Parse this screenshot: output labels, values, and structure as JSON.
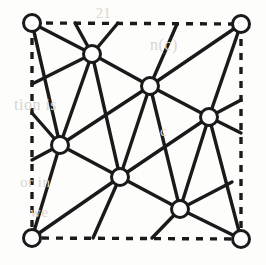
{
  "figure": {
    "canvas": {
      "width": 266,
      "height": 265
    },
    "colors": {
      "background": "#fdfdfc",
      "edge": "#1a1a1a",
      "vertex_fill": "#ffffff",
      "vertex_stroke": "#1a1a1a",
      "boundary": "#1a1a1a",
      "ghost_text": "#d8d5cf"
    },
    "style": {
      "edge_width": 3.4,
      "vertex_radius": 8.5,
      "vertex_stroke_width": 3.0,
      "boundary_width": 3.4,
      "boundary_dash": "7 7"
    }
  },
  "boundary": {
    "name": "fundamental-domain-square",
    "line_style": "dashed",
    "corners": [
      {
        "id": "c-tl",
        "label": "top-left",
        "x": 32,
        "y": 23
      },
      {
        "id": "c-tr",
        "label": "top-right",
        "x": 241,
        "y": 24
      },
      {
        "id": "c-br",
        "label": "bottom-right",
        "x": 241,
        "y": 239
      },
      {
        "id": "c-bl",
        "label": "bottom-left",
        "x": 32,
        "y": 238
      }
    ]
  },
  "vertices": [
    {
      "id": "v-tl",
      "kind": "corner",
      "x": 32,
      "y": 23
    },
    {
      "id": "v-tr",
      "kind": "corner",
      "x": 241,
      "y": 24
    },
    {
      "id": "v-bl",
      "kind": "corner",
      "x": 32,
      "y": 238
    },
    {
      "id": "v-br",
      "kind": "corner",
      "x": 241,
      "y": 239
    },
    {
      "id": "v-a",
      "kind": "interior",
      "x": 92,
      "y": 54
    },
    {
      "id": "v-b",
      "kind": "interior",
      "x": 150,
      "y": 86
    },
    {
      "id": "v-c",
      "kind": "interior",
      "x": 209,
      "y": 117
    },
    {
      "id": "v-d",
      "kind": "interior",
      "x": 60,
      "y": 145
    },
    {
      "id": "v-e",
      "kind": "interior",
      "x": 120,
      "y": 177
    },
    {
      "id": "v-f",
      "kind": "interior",
      "x": 180,
      "y": 209
    }
  ],
  "edges": [
    {
      "id": "e01",
      "x1": 32,
      "y1": 23,
      "x2": 92,
      "y2": 54
    },
    {
      "id": "e02",
      "x1": 92,
      "y1": 54,
      "x2": 150,
      "y2": 86
    },
    {
      "id": "e03",
      "x1": 150,
      "y1": 86,
      "x2": 209,
      "y2": 117
    },
    {
      "id": "e04",
      "x1": 209,
      "y1": 117,
      "x2": 241,
      "y2": 133
    },
    {
      "id": "e05",
      "x1": 32,
      "y1": 113,
      "x2": 60,
      "y2": 145
    },
    {
      "id": "e06",
      "x1": 60,
      "y1": 145,
      "x2": 120,
      "y2": 177
    },
    {
      "id": "e07",
      "x1": 120,
      "y1": 177,
      "x2": 180,
      "y2": 209
    },
    {
      "id": "e08",
      "x1": 180,
      "y1": 209,
      "x2": 241,
      "y2": 239
    },
    {
      "id": "e09",
      "x1": 32,
      "y1": 238,
      "x2": 60,
      "y2": 145
    },
    {
      "id": "e10",
      "x1": 60,
      "y1": 145,
      "x2": 92,
      "y2": 54
    },
    {
      "id": "e11",
      "x1": 92,
      "y1": 54,
      "x2": 118,
      "y2": 23
    },
    {
      "id": "e12",
      "x1": 120,
      "y1": 177,
      "x2": 150,
      "y2": 86
    },
    {
      "id": "e13",
      "x1": 150,
      "y1": 86,
      "x2": 177,
      "y2": 24
    },
    {
      "id": "e14",
      "x1": 180,
      "y1": 209,
      "x2": 209,
      "y2": 117
    },
    {
      "id": "e15",
      "x1": 209,
      "y1": 117,
      "x2": 241,
      "y2": 24
    },
    {
      "id": "e16",
      "x1": 32,
      "y1": 238,
      "x2": 120,
      "y2": 177
    },
    {
      "id": "e17",
      "x1": 60,
      "y1": 145,
      "x2": 150,
      "y2": 86
    },
    {
      "id": "e18",
      "x1": 92,
      "y1": 54,
      "x2": 32,
      "y2": 84
    },
    {
      "id": "e19",
      "x1": 120,
      "y1": 177,
      "x2": 209,
      "y2": 117
    },
    {
      "id": "e20",
      "x1": 150,
      "y1": 86,
      "x2": 241,
      "y2": 24
    },
    {
      "id": "e21",
      "x1": 180,
      "y1": 209,
      "x2": 232,
      "y2": 182
    },
    {
      "id": "e22",
      "x1": 92,
      "y1": 54,
      "x2": 75,
      "y2": 23
    },
    {
      "id": "e23",
      "x1": 60,
      "y1": 145,
      "x2": 32,
      "y2": 160
    },
    {
      "id": "e24",
      "x1": 120,
      "y1": 177,
      "x2": 93,
      "y2": 238
    },
    {
      "id": "e25",
      "x1": 180,
      "y1": 209,
      "x2": 152,
      "y2": 238
    },
    {
      "id": "e26",
      "x1": 209,
      "y1": 117,
      "x2": 241,
      "y2": 100
    },
    {
      "id": "e27",
      "x1": 32,
      "y1": 23,
      "x2": 60,
      "y2": 145
    },
    {
      "id": "e28",
      "x1": 92,
      "y1": 54,
      "x2": 120,
      "y2": 177
    },
    {
      "id": "e29",
      "x1": 150,
      "y1": 86,
      "x2": 180,
      "y2": 209
    },
    {
      "id": "e30",
      "x1": 209,
      "y1": 117,
      "x2": 241,
      "y2": 239
    }
  ],
  "ghost_text_fragments": [
    {
      "id": "g1",
      "text": "n(c)",
      "x": 150,
      "y": 36,
      "size": 16
    },
    {
      "id": "g2",
      "text": "tion is",
      "x": 14,
      "y": 96,
      "size": 16
    },
    {
      "id": "g3",
      "text": "c",
      "x": 160,
      "y": 123,
      "size": 15
    },
    {
      "id": "g4",
      "text": "or in",
      "x": 20,
      "y": 174,
      "size": 15
    },
    {
      "id": "g5",
      "text": "we",
      "x": 30,
      "y": 204,
      "size": 15
    },
    {
      "id": "g6",
      "text": "21",
      "x": 96,
      "y": 6,
      "size": 14
    }
  ]
}
